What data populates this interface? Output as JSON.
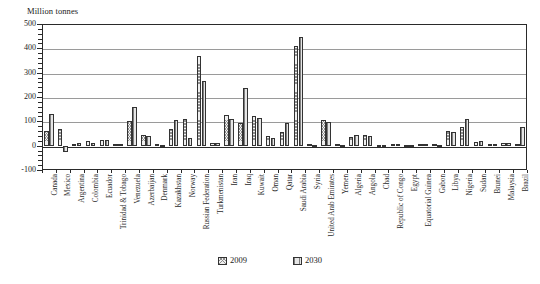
{
  "chart_data": {
    "type": "bar",
    "title": "",
    "subtitle": "",
    "xlabel": "",
    "ylabel": "Million tonnes",
    "ylim": [
      -100,
      500
    ],
    "ytick_step": 100,
    "yticks": [
      -100,
      0,
      100,
      200,
      300,
      400,
      500
    ],
    "ytick_labels": [
      "-100",
      "0",
      "100",
      "200",
      "300",
      "400",
      "500"
    ],
    "grid": true,
    "grid_axis": "y",
    "legend_position": "bottom-center",
    "legend": [
      "2009",
      "2030"
    ],
    "categories": [
      "Canada",
      "Mexico",
      "Argentina",
      "Colombia",
      "Ecuador",
      "Trinidad & Tobago",
      "Venezuela",
      "Azerbaijan",
      "Denmark",
      "Kazakhstan",
      "Norway",
      "Russian Federation",
      "Turkmenistan",
      "Iran",
      "Iraq",
      "Kuwait",
      "Oman",
      "Qatar",
      "Saudi Arabia",
      "Syria",
      "United Arab Emirates",
      "Yemen",
      "Algeria",
      "Angola",
      "Chad",
      "Republic of Congo",
      "Egypt",
      "Equatorial Guinea",
      "Gabon",
      "Libya",
      "Nigeria",
      "Sudan",
      "Brunei",
      "Malaysia",
      "Brazil"
    ],
    "series": [
      {
        "name": "2009",
        "values": [
          60,
          68,
          8,
          18,
          22,
          8,
          100,
          45,
          7,
          67,
          110,
          370,
          10,
          125,
          95,
          120,
          38,
          55,
          410,
          5,
          105,
          6,
          35,
          42,
          4,
          6,
          3,
          7,
          6,
          62,
          78,
          14,
          7,
          12,
          5
        ]
      },
      {
        "name": "2030",
        "values": [
          130,
          -25,
          10,
          12,
          25,
          6,
          158,
          40,
          3,
          105,
          30,
          265,
          12,
          110,
          235,
          112,
          33,
          95,
          445,
          3,
          98,
          4,
          42,
          40,
          4,
          8,
          2,
          7,
          4,
          57,
          108,
          18,
          5,
          9,
          75
        ]
      }
    ]
  }
}
